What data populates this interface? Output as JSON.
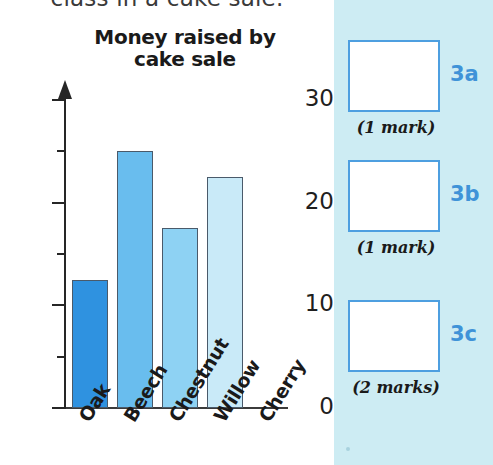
{
  "page": {
    "cut_off_question_text": "class in a cake sale."
  },
  "chart_data": {
    "type": "bar",
    "title": "Money raised by cake sale",
    "title_line1": "Money raised by",
    "title_line2": "cake sale",
    "xlabel": "",
    "ylabel": "",
    "ylim": [
      0,
      30
    ],
    "yticks_major": [
      0,
      10,
      20,
      30
    ],
    "yticks_minor": [
      5,
      15,
      25
    ],
    "grid": false,
    "legend": "none",
    "categories": [
      "Oak",
      "Beech",
      "Chestnut",
      "Willow",
      "Cherry"
    ],
    "values": [
      12.5,
      25,
      17.5,
      22.5,
      0
    ],
    "bar_colors": [
      "#2f92e0",
      "#69bdee",
      "#8ed2f3",
      "#c9eaf8",
      "#ffffff"
    ],
    "bar_border_color": "#4a5a6a",
    "axis_color": "#262626"
  },
  "answer_panel": {
    "background_color": "#cdecf3",
    "box_border_color": "#4d9fe0",
    "code_color": "#3f93d8",
    "items": [
      {
        "code": "3a",
        "marks": "(1 mark)"
      },
      {
        "code": "3b",
        "marks": "(1 mark)"
      },
      {
        "code": "3c",
        "marks": "(2 marks)"
      }
    ]
  }
}
